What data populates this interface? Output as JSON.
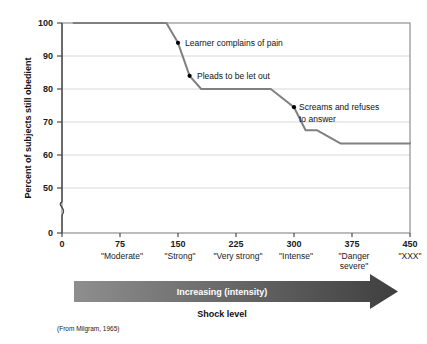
{
  "figure": {
    "source_note": "(From Milgram, 1965)",
    "background_color": "#ffffff"
  },
  "chart_data": {
    "type": "line",
    "title": "",
    "xlabel": "Shock level",
    "ylabel": "Percent of subjects still obedient",
    "xlim": [
      0,
      450
    ],
    "ylim": [
      0,
      100
    ],
    "y_axis_break": true,
    "y_break_between": [
      0,
      50
    ],
    "grid": true,
    "grid_orientation": "horizontal",
    "legend": "none",
    "line_color": "#808080",
    "marker_color": "#000000",
    "x_ticks": [
      0,
      75,
      150,
      225,
      300,
      375,
      450
    ],
    "x_tick_labels": [
      "0",
      "75",
      "150",
      "225",
      "300",
      "375",
      "450"
    ],
    "y_ticks": [
      0,
      50,
      60,
      70,
      80,
      90,
      100
    ],
    "y_tick_labels": [
      "0",
      "50",
      "60",
      "70",
      "80",
      "90",
      "100"
    ],
    "x_category_labels": [
      {
        "value": 75,
        "label": "\"Moderate\""
      },
      {
        "value": 150,
        "label": "\"Strong\""
      },
      {
        "value": 225,
        "label": "\"Very strong\""
      },
      {
        "value": 300,
        "label": "\"Intense\""
      },
      {
        "value": 375,
        "label": "\"Danger severe\"",
        "line1": "\"Danger",
        "line2": "severe\""
      },
      {
        "value": 450,
        "label": "\"XXX\""
      }
    ],
    "x": [
      15,
      135,
      150,
      165,
      180,
      270,
      300,
      315,
      330,
      360,
      450
    ],
    "values": [
      100,
      100,
      94,
      84,
      80,
      80,
      74.5,
      67.5,
      67.5,
      63.5,
      63.5
    ],
    "series": [
      {
        "name": "Percent still obedient",
        "points": [
          {
            "x": 15,
            "y": 100
          },
          {
            "x": 135,
            "y": 100
          },
          {
            "x": 150,
            "y": 94
          },
          {
            "x": 165,
            "y": 84
          },
          {
            "x": 180,
            "y": 80
          },
          {
            "x": 270,
            "y": 80
          },
          {
            "x": 300,
            "y": 74.5
          },
          {
            "x": 315,
            "y": 67.5
          },
          {
            "x": 330,
            "y": 67.5
          },
          {
            "x": 360,
            "y": 63.5
          },
          {
            "x": 450,
            "y": 63.5
          }
        ]
      }
    ],
    "annotations": [
      {
        "text": "Learner complains of pain",
        "lines": [
          "Learner complains of pain"
        ],
        "point_x": 150,
        "point_y": 94
      },
      {
        "text": "Pleads to be let out",
        "lines": [
          "Pleads to be let out"
        ],
        "point_x": 165,
        "point_y": 84
      },
      {
        "text": "Screams and refuses to answer",
        "lines": [
          "Screams and refuses",
          "to answer"
        ],
        "point_x": 300,
        "point_y": 74.5
      }
    ]
  },
  "arrow_banner": {
    "label": "Increasing (intensity)",
    "color_start": "#8e8e8e",
    "color_end": "#3f3f3f"
  },
  "bottom_label": {
    "text": "Shock level"
  }
}
